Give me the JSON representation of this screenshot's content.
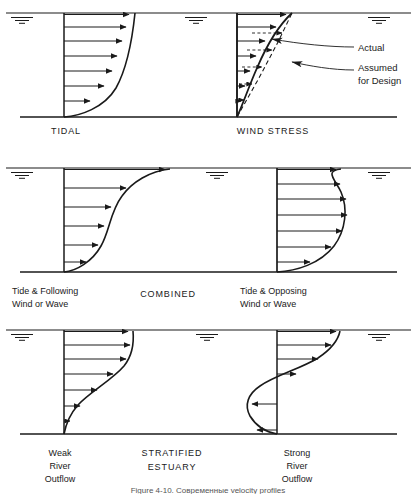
{
  "figure": {
    "caption": "Figure 4-10.  Современные velocity profiles",
    "background_color": "#ffffff",
    "ink_color": "#1a1a1a"
  },
  "panels": [
    {
      "id": "panel-tidal",
      "surface_y": 13,
      "bed_y": 117,
      "cases": [
        {
          "id": "tidal",
          "title": "TIDAL",
          "title_x": 66,
          "axis_x": 64,
          "arrow_count": 7,
          "profile_type": "power-law",
          "max_velocity_at": "surface"
        },
        {
          "id": "wind-stress",
          "title": "WIND STRESS",
          "title_x": 273,
          "axis_x": 237,
          "arrow_count": 7,
          "profile_type": "power-law-with-design-overlay",
          "max_velocity_at": "surface"
        }
      ],
      "annotations": [
        {
          "id": "actual",
          "label": "Actual",
          "x": 358,
          "y": 48,
          "curve": "solid"
        },
        {
          "id": "assumed",
          "label_line1": "Assumed",
          "label_line2": "for Design",
          "x": 358,
          "y": 69,
          "curve": "dashed"
        }
      ]
    },
    {
      "id": "panel-combined",
      "surface_y": 168,
      "bed_y": 272,
      "group_title": "COMBINED",
      "group_title_x": 168,
      "group_title_y": 294,
      "cases": [
        {
          "id": "tide-following",
          "label_line1": "Tide & Following",
          "label_line2": "Wind or Wave",
          "label_x": 12,
          "axis_x": 64,
          "arrow_count": 6,
          "profile_type": "s-curve",
          "max_velocity_at": "surface"
        },
        {
          "id": "tide-opposing",
          "label_line1": "Tide & Opposing",
          "label_line2": "Wind or Wave",
          "label_x": 240,
          "axis_x": 277,
          "arrow_count": 7,
          "profile_type": "bulged",
          "max_velocity_at": "mid-depth"
        }
      ]
    },
    {
      "id": "panel-stratified",
      "surface_y": 330,
      "bed_y": 434,
      "group_title_line1": "STRATIFIED",
      "group_title_line2": "ESTUARY",
      "group_title_x": 172,
      "group_title_y": 459,
      "cases": [
        {
          "id": "weak-river-outflow",
          "label_line1": "Weak",
          "label_line2": "River",
          "label_line3": "Outflow",
          "label_x": 60,
          "axis_x": 64,
          "arrow_count": 7,
          "profile_type": "jet",
          "max_velocity_at": "upper-layer",
          "reversal": false
        },
        {
          "id": "strong-river-outflow",
          "label_line1": "Strong",
          "label_line2": "River",
          "label_line3": "Outflow",
          "label_x": 297,
          "axis_x": 277,
          "arrow_count": 7,
          "profile_type": "two-layer-reversing",
          "max_velocity_at": "upper-layer",
          "reversal": true,
          "reversed_arrow_count": 2
        }
      ]
    }
  ]
}
